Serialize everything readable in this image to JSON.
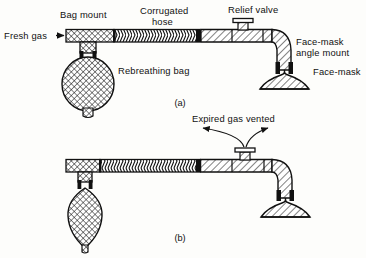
{
  "figure": {
    "type": "technical-line-diagram",
    "background_color": "#fdfdfb",
    "ink_color": "#111111",
    "panels": [
      {
        "id": "a",
        "caption": "(a)",
        "state": "inspiration - rebreathing bag inflated",
        "labels": {
          "fresh_gas": "Fresh gas",
          "fresh_gas_arrow": "right-arrow-glyph",
          "bag_mount": "Bag mount",
          "corrugated_hose_line1": "Corrugated",
          "corrugated_hose_line2": "hose",
          "relief_valve": "Relief valve",
          "rebreathing_bag": "Rebreathing bag",
          "face_mask_angle_mount_line1": "Face-mask",
          "face_mask_angle_mount_line2": "angle mount",
          "face_mask": "Face-mask"
        }
      },
      {
        "id": "b",
        "caption": "(b)",
        "state": "expiration - rebreathing bag deflated, gas vented",
        "labels": {
          "expired_gas_vented": "Expired gas vented"
        }
      }
    ],
    "components": [
      "Fresh gas inlet",
      "Bag mount",
      "Rebreathing bag",
      "Corrugated hose",
      "Relief valve",
      "Face-mask angle mount",
      "Face-mask"
    ]
  }
}
